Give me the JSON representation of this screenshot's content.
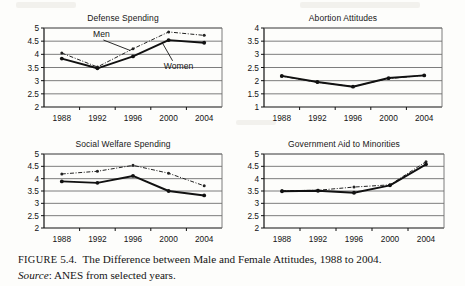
{
  "figure": {
    "label": "FIGURE",
    "number": "5.4.",
    "caption_line1": "The Difference between Male and Female Attitudes, 1988 to 2004.",
    "source_label": "Source",
    "source_text": ": ANES from selected years."
  },
  "annotations": {
    "men": "Men",
    "women": "Women"
  },
  "colors": {
    "men_line": "#222222",
    "women_line": "#111111",
    "axis": "#111111",
    "gridline": "#6e6e6e",
    "background": "#fdfdfb",
    "text": "#141414"
  },
  "chart_data": [
    {
      "type": "line",
      "title": "Defense Spending",
      "xlabel": "",
      "ylabel": "",
      "categories": [
        "1988",
        "1992",
        "1996",
        "2000",
        "2004"
      ],
      "ylim": [
        2,
        5
      ],
      "yticks": [
        "2",
        "2.5",
        "3",
        "3.5",
        "4",
        "4.5",
        "5"
      ],
      "grid": true,
      "legend": "annotated-inline",
      "series": [
        {
          "name": "Men",
          "style": "dash-dot",
          "values": [
            4.05,
            3.52,
            4.21,
            4.85,
            4.72
          ]
        },
        {
          "name": "Women",
          "style": "solid",
          "values": [
            3.84,
            3.47,
            3.92,
            4.54,
            4.44
          ]
        }
      ],
      "annotations": [
        {
          "text": "Men",
          "x": "between 1988 and 1996",
          "points_to": "men series at 1996"
        },
        {
          "text": "Women",
          "x": "between 1996 and 2004",
          "points_to": "women series at 2000"
        }
      ]
    },
    {
      "type": "line",
      "title": "Abortion Attitudes",
      "xlabel": "",
      "ylabel": "",
      "categories": [
        "1988",
        "1992",
        "1996",
        "2000",
        "2004"
      ],
      "ylim": [
        1,
        4
      ],
      "yticks": [
        "1",
        "1.5",
        "2",
        "2.5",
        "3",
        "3.5",
        "4"
      ],
      "grid": true,
      "legend": "none",
      "series": [
        {
          "name": "Men",
          "style": "dash-dot",
          "values": [
            2.17,
            1.94,
            1.78,
            2.08,
            2.2
          ]
        },
        {
          "name": "Women",
          "style": "solid",
          "values": [
            2.18,
            1.95,
            1.77,
            2.1,
            2.2
          ]
        }
      ],
      "annotations": []
    },
    {
      "type": "line",
      "title": "Social Welfare Spending",
      "xlabel": "",
      "ylabel": "",
      "categories": [
        "1988",
        "1992",
        "1996",
        "2000",
        "2004"
      ],
      "ylim": [
        2,
        5
      ],
      "yticks": [
        "2",
        "2.5",
        "3",
        "3.5",
        "4",
        "4.5",
        "5"
      ],
      "grid": true,
      "legend": "none",
      "series": [
        {
          "name": "Men",
          "style": "dash-dot",
          "values": [
            4.19,
            4.3,
            4.54,
            4.22,
            3.71
          ]
        },
        {
          "name": "Women",
          "style": "solid",
          "values": [
            3.89,
            3.83,
            4.11,
            3.5,
            3.32
          ]
        }
      ],
      "annotations": []
    },
    {
      "type": "line",
      "title": "Government Aid to Minorities",
      "xlabel": "",
      "ylabel": "",
      "categories": [
        "1988",
        "1992",
        "1996",
        "2000",
        "2004"
      ],
      "ylim": [
        2,
        5
      ],
      "yticks": [
        "2",
        "2.5",
        "3",
        "3.5",
        "4",
        "4.5",
        "5"
      ],
      "grid": true,
      "legend": "none",
      "series": [
        {
          "name": "Men",
          "style": "dash-dot",
          "values": [
            3.51,
            3.53,
            3.66,
            3.75,
            4.69
          ]
        },
        {
          "name": "Women",
          "style": "solid",
          "values": [
            3.49,
            3.51,
            3.43,
            3.73,
            4.58
          ]
        }
      ],
      "annotations": []
    }
  ]
}
